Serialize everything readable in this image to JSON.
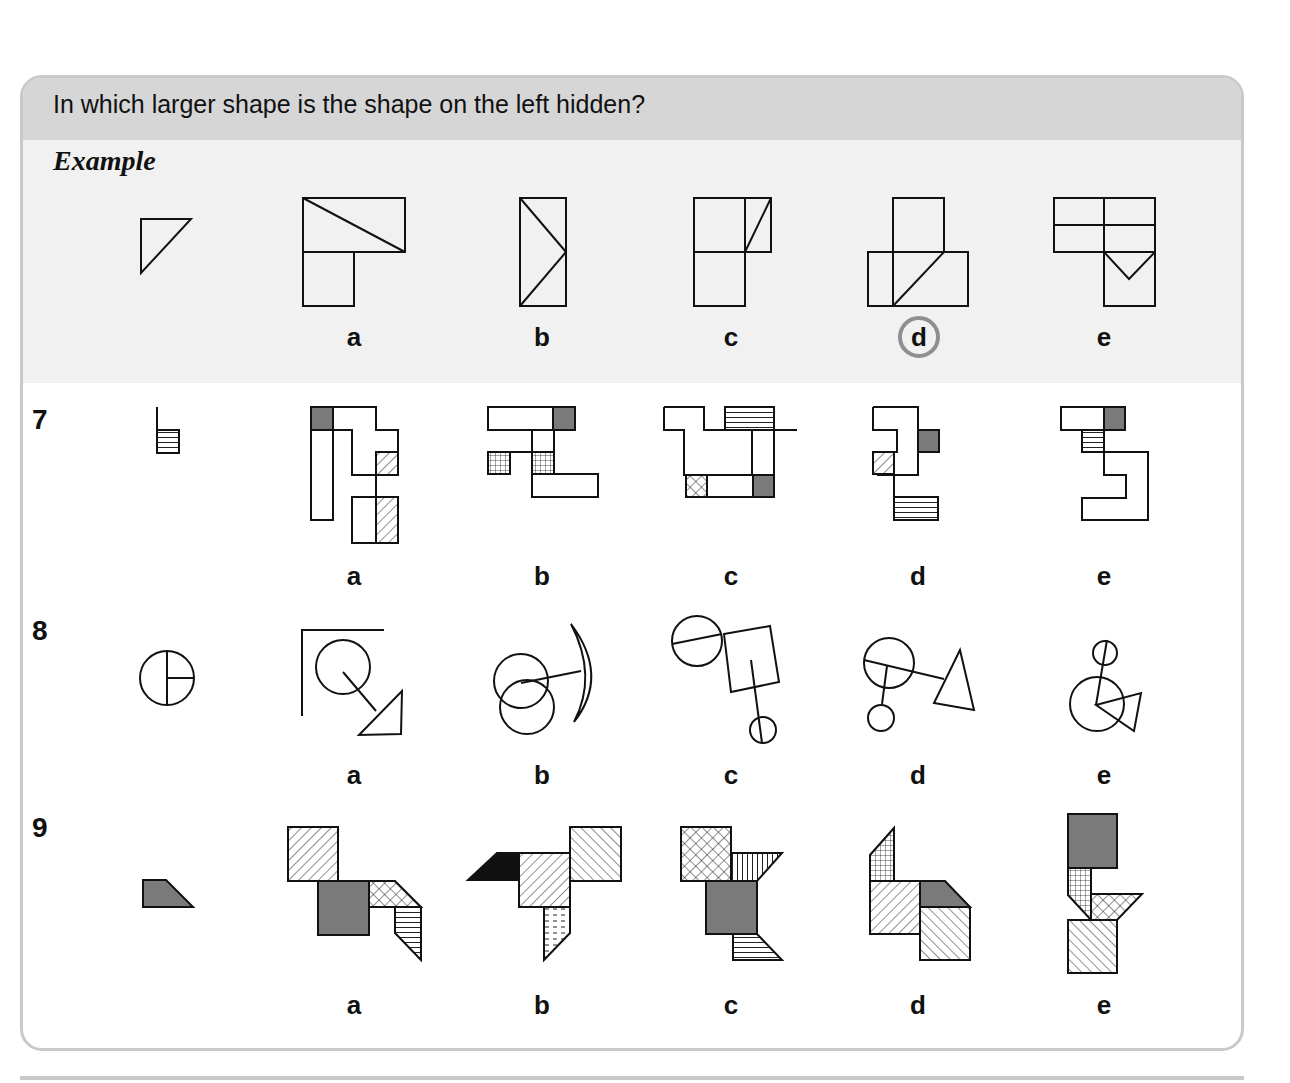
{
  "header": {
    "question": "In which larger shape is the shape on the left hidden?"
  },
  "example": {
    "label": "Example",
    "options": [
      "a",
      "b",
      "c",
      "d",
      "e"
    ],
    "answer": "d"
  },
  "questions": [
    {
      "number": "7",
      "options": [
        "a",
        "b",
        "c",
        "d",
        "e"
      ]
    },
    {
      "number": "8",
      "options": [
        "a",
        "b",
        "c",
        "d",
        "e"
      ]
    },
    {
      "number": "9",
      "options": [
        "a",
        "b",
        "c",
        "d",
        "e"
      ]
    }
  ],
  "colors": {
    "header_bg": "#d6d6d6",
    "example_bg": "#f1f1f1",
    "border": "#c9c9c9",
    "shade_gray": "#7a7a7a",
    "answer_ring": "#8f8f8f"
  }
}
